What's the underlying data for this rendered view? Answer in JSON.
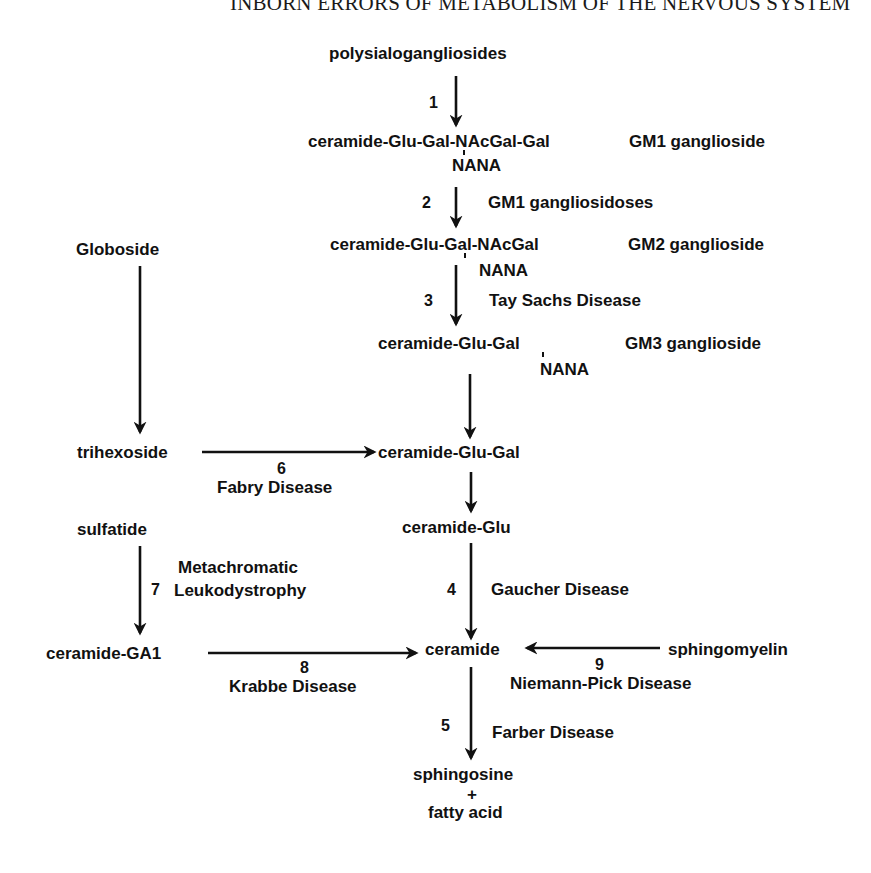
{
  "header": {
    "running_title": "INBORN ERRORS OF METABOLISM OF THE NERVOUS SYSTEM"
  },
  "diagram": {
    "compounds": {
      "polysialogangliosides": "polysialogangliosides",
      "gm1_structure": "ceramide-Glu-Gal-NAcGal-Gal",
      "gm1_nana": "NANA",
      "gm1_name": "GM1 ganglioside",
      "gm2_structure": "ceramide-Glu-Gal-NAcGal",
      "gm2_nana": "NANA",
      "gm2_name": "GM2 ganglioside",
      "gm3_structure": "ceramide-Glu-Gal",
      "gm3_nana": "NANA",
      "gm3_name": "GM3 ganglioside",
      "globoside": "Globoside",
      "trihexoside": "trihexoside",
      "ceramide_glu_gal": "ceramide-Glu-Gal",
      "ceramide_glu": "ceramide-Glu",
      "sulfatide": "sulfatide",
      "ceramide_ga1": "ceramide-GA1",
      "ceramide": "ceramide",
      "sphingomyelin": "sphingomyelin",
      "sphingosine": "sphingosine",
      "plus": "+",
      "fatty_acid": "fatty acid"
    },
    "steps": [
      {
        "number": "1",
        "disease": ""
      },
      {
        "number": "2",
        "disease": "GM1 gangliosidoses"
      },
      {
        "number": "3",
        "disease": "Tay Sachs Disease"
      },
      {
        "number": "4",
        "disease": "Gaucher Disease"
      },
      {
        "number": "5",
        "disease": "Farber Disease"
      },
      {
        "number": "6",
        "disease": "Fabry Disease"
      },
      {
        "number": "7",
        "disease_line1": "Metachromatic",
        "disease_line2": "Leukodystrophy"
      },
      {
        "number": "8",
        "disease": "Krabbe Disease"
      },
      {
        "number": "9",
        "disease": "Niemann-Pick Disease"
      }
    ]
  }
}
